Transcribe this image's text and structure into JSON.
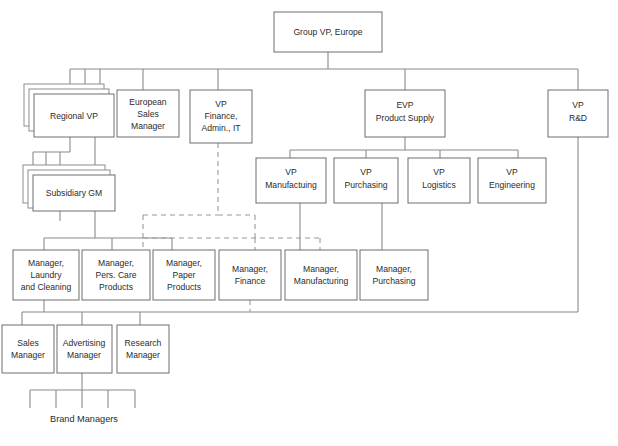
{
  "diagram": {
    "type": "organization-chart",
    "title_node": "Group VP, Europe",
    "colors": {
      "box_fill": "#ffffff",
      "box_stroke": "#6e6e6e",
      "line_solid": "#8a8a8a",
      "line_dashed": "#9a9a9a",
      "text": "#2b2b2b",
      "background": "#ffffff"
    },
    "free_labels": [
      {
        "id": "brand-managers",
        "text": "Brand Managers"
      }
    ],
    "nodes": [
      {
        "id": "group-vp-europe",
        "lines": [
          "Group VP, Europe"
        ],
        "stacked": false
      },
      {
        "id": "regional-vp",
        "lines": [
          "Regional VP"
        ],
        "stacked": true
      },
      {
        "id": "european-sales-manager",
        "lines": [
          "European",
          "Sales",
          "Manager"
        ],
        "stacked": false
      },
      {
        "id": "vp-finance-admin-it",
        "lines": [
          "VP",
          "Finance,",
          "Admin., IT"
        ],
        "stacked": false
      },
      {
        "id": "evp-product-supply",
        "lines": [
          "EVP",
          "Product Supply"
        ],
        "stacked": false
      },
      {
        "id": "vp-rd",
        "lines": [
          "VP",
          "R&D"
        ],
        "stacked": false
      },
      {
        "id": "subsidiary-gm",
        "lines": [
          "Subsidiary GM"
        ],
        "stacked": true
      },
      {
        "id": "vp-manufacturing",
        "lines": [
          "VP",
          "Manufactuing"
        ],
        "stacked": false
      },
      {
        "id": "vp-purchasing",
        "lines": [
          "VP",
          "Purchasing"
        ],
        "stacked": false
      },
      {
        "id": "vp-logistics",
        "lines": [
          "VP",
          "Logistics"
        ],
        "stacked": false
      },
      {
        "id": "vp-engineering",
        "lines": [
          "VP",
          "Engineering"
        ],
        "stacked": false
      },
      {
        "id": "manager-laundry-cleaning",
        "lines": [
          "Manager,",
          "Laundry",
          "and Cleaning"
        ],
        "stacked": false
      },
      {
        "id": "manager-pers-care",
        "lines": [
          "Manager,",
          "Pers. Care",
          "Products"
        ],
        "stacked": false
      },
      {
        "id": "manager-paper",
        "lines": [
          "Manager,",
          "Paper",
          "Products"
        ],
        "stacked": false
      },
      {
        "id": "manager-finance",
        "lines": [
          "Manager,",
          "Finance"
        ],
        "stacked": false
      },
      {
        "id": "manager-manufacturing",
        "lines": [
          "Manager,",
          "Manufacturing"
        ],
        "stacked": false
      },
      {
        "id": "manager-purchasing",
        "lines": [
          "Manager,",
          "Purchasing"
        ],
        "stacked": false
      },
      {
        "id": "sales-manager",
        "lines": [
          "Sales",
          "Manager"
        ],
        "stacked": false
      },
      {
        "id": "advertising-manager",
        "lines": [
          "Advertising",
          "Manager"
        ],
        "stacked": false
      },
      {
        "id": "research-manager",
        "lines": [
          "Research",
          "Manager"
        ],
        "stacked": false
      }
    ],
    "relationships": [
      {
        "from": "group-vp-europe",
        "to": "regional-vp",
        "style": "solid"
      },
      {
        "from": "group-vp-europe",
        "to": "european-sales-manager",
        "style": "solid"
      },
      {
        "from": "group-vp-europe",
        "to": "vp-finance-admin-it",
        "style": "solid"
      },
      {
        "from": "group-vp-europe",
        "to": "evp-product-supply",
        "style": "solid"
      },
      {
        "from": "group-vp-europe",
        "to": "vp-rd",
        "style": "solid"
      },
      {
        "from": "regional-vp",
        "to": "subsidiary-gm",
        "style": "solid"
      },
      {
        "from": "regional-vp",
        "to": "manager-laundry-cleaning",
        "style": "solid"
      },
      {
        "from": "regional-vp",
        "to": "manager-pers-care",
        "style": "solid"
      },
      {
        "from": "evp-product-supply",
        "to": "vp-manufacturing",
        "style": "solid"
      },
      {
        "from": "evp-product-supply",
        "to": "vp-purchasing",
        "style": "solid"
      },
      {
        "from": "evp-product-supply",
        "to": "vp-logistics",
        "style": "solid"
      },
      {
        "from": "evp-product-supply",
        "to": "vp-engineering",
        "style": "solid"
      },
      {
        "from": "vp-manufacturing",
        "to": "manager-manufacturing",
        "style": "solid"
      },
      {
        "from": "vp-purchasing",
        "to": "manager-purchasing",
        "style": "solid"
      },
      {
        "from": "vp-finance-admin-it",
        "to": "manager-paper",
        "style": "dashed"
      },
      {
        "from": "vp-finance-admin-it",
        "to": "manager-finance",
        "style": "dashed"
      },
      {
        "from": "vp-finance-admin-it",
        "to": "manager-manufacturing",
        "style": "dashed"
      },
      {
        "from": "manager-laundry-cleaning",
        "to": "sales-manager",
        "style": "solid"
      },
      {
        "from": "manager-laundry-cleaning",
        "to": "advertising-manager",
        "style": "solid"
      },
      {
        "from": "manager-laundry-cleaning",
        "to": "research-manager",
        "style": "solid"
      },
      {
        "from": "manager-finance",
        "to": "research-manager",
        "style": "dashed"
      },
      {
        "from": "vp-rd",
        "to": "research-manager",
        "style": "solid"
      },
      {
        "from": "advertising-manager",
        "to": "brand-managers",
        "style": "solid"
      }
    ]
  }
}
